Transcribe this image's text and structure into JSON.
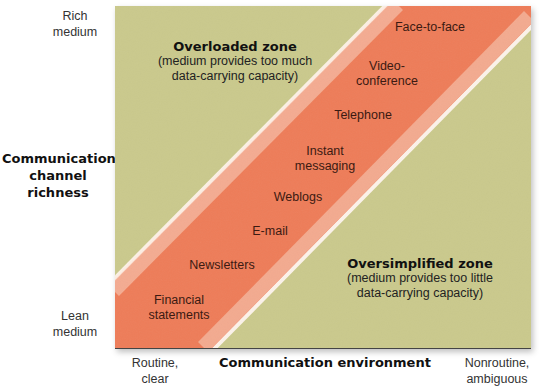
{
  "colors": {
    "zone_fill": "#cac98c",
    "band_fill": "#ee7c58",
    "band_edge": "#fff4ee",
    "band_text": "#3b1a12"
  },
  "y_axis": {
    "title_line1": "Communication",
    "title_line2": "channel",
    "title_line3": "richness",
    "top_line1": "Rich",
    "top_line2": "medium",
    "bottom_line1": "Lean",
    "bottom_line2": "medium"
  },
  "x_axis": {
    "title": "Communication environment",
    "left_line1": "Routine,",
    "left_line2": "clear",
    "right_line1": "Nonroutine,",
    "right_line2": "ambiguous"
  },
  "overloaded_zone": {
    "title": "Overloaded zone",
    "desc_line1": "(medium provides too much",
    "desc_line2": "data-carrying capacity)"
  },
  "oversimplified_zone": {
    "title": "Oversimplified zone",
    "desc_line1": "(medium provides too little",
    "desc_line2": "data-carrying capacity)"
  },
  "media": [
    {
      "line1": "Face-to-face",
      "line2": ""
    },
    {
      "line1": "Video-",
      "line2": "conference"
    },
    {
      "line1": "Telephone",
      "line2": ""
    },
    {
      "line1": "Instant",
      "line2": "messaging"
    },
    {
      "line1": "Weblogs",
      "line2": ""
    },
    {
      "line1": "E-mail",
      "line2": ""
    },
    {
      "line1": "Newsletters",
      "line2": ""
    },
    {
      "line1": "Financial",
      "line2": "statements"
    }
  ]
}
